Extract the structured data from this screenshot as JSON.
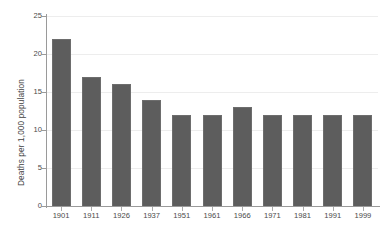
{
  "chart_data": {
    "type": "bar",
    "title": "",
    "subtitle": "",
    "xlabel": "",
    "ylabel": "Deaths per 1,000 population",
    "categories": [
      "1901",
      "1911",
      "1926",
      "1937",
      "1951",
      "1961",
      "1966",
      "1971",
      "1981",
      "1991",
      "1999"
    ],
    "values": [
      22,
      17,
      16,
      14,
      12,
      12,
      13,
      12,
      12,
      12,
      12
    ],
    "ylim": [
      0,
      25
    ],
    "y_ticks": [
      "0",
      "5",
      "10",
      "15",
      "20",
      "25"
    ],
    "y_tick_values": [
      0,
      5,
      10,
      15,
      20,
      25
    ],
    "grid": "horizontal",
    "legend": "none",
    "bar_color": "#5d5d5d",
    "gridline_color": "#ededed",
    "axis_color": "#9a9a9a",
    "background_color": "#ffffff"
  }
}
